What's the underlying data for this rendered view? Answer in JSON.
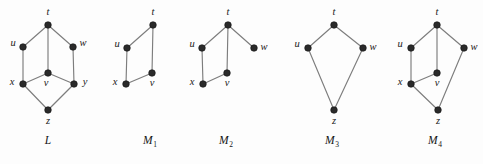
{
  "figure": {
    "background_color": "#fdfdfd",
    "edge_color": "#7d7d7d",
    "vertex_color": "#2a2a2a",
    "label_color": "#1a1a1a",
    "vertex_radius": 3.3,
    "graphs": [
      {
        "id": "L",
        "caption": "L",
        "caption_sub": "",
        "caption_x": 48,
        "caption_y": 144,
        "vertices": [
          {
            "id": "t",
            "label": "t",
            "cx": 48,
            "cy": 25,
            "lx": 48,
            "ly": 15,
            "anchor": "middle"
          },
          {
            "id": "u",
            "label": "u",
            "cx": 23,
            "cy": 47,
            "lx": 13,
            "ly": 46,
            "anchor": "middle"
          },
          {
            "id": "w",
            "label": "w",
            "cx": 73,
            "cy": 47,
            "lx": 83,
            "ly": 46,
            "anchor": "middle"
          },
          {
            "id": "v",
            "label": "v",
            "cx": 48,
            "cy": 73,
            "lx": 46,
            "ly": 86,
            "anchor": "middle"
          },
          {
            "id": "x",
            "label": "x",
            "cx": 23,
            "cy": 84,
            "lx": 12,
            "ly": 85,
            "anchor": "middle"
          },
          {
            "id": "y",
            "label": "y",
            "cx": 74,
            "cy": 84,
            "lx": 85,
            "ly": 85,
            "anchor": "middle"
          },
          {
            "id": "z",
            "label": "z",
            "cx": 48,
            "cy": 110,
            "lx": 48,
            "ly": 124,
            "anchor": "middle"
          }
        ],
        "edges": [
          [
            "t",
            "u"
          ],
          [
            "t",
            "w"
          ],
          [
            "t",
            "v"
          ],
          [
            "u",
            "x"
          ],
          [
            "w",
            "y"
          ],
          [
            "v",
            "x"
          ],
          [
            "v",
            "y"
          ],
          [
            "x",
            "z"
          ],
          [
            "y",
            "z"
          ]
        ]
      },
      {
        "id": "M1",
        "caption": "M",
        "caption_sub": "1",
        "caption_x": 150,
        "caption_y": 144,
        "vertices": [
          {
            "id": "t",
            "label": "t",
            "cx": 153,
            "cy": 25,
            "lx": 153,
            "ly": 15,
            "anchor": "middle"
          },
          {
            "id": "u",
            "label": "u",
            "cx": 127,
            "cy": 48,
            "lx": 117,
            "ly": 47,
            "anchor": "middle"
          },
          {
            "id": "v",
            "label": "v",
            "cx": 152,
            "cy": 73,
            "lx": 152,
            "ly": 86,
            "anchor": "middle"
          },
          {
            "id": "x",
            "label": "x",
            "cx": 126,
            "cy": 84,
            "lx": 115,
            "ly": 85,
            "anchor": "middle"
          }
        ],
        "edges": [
          [
            "t",
            "u"
          ],
          [
            "t",
            "v"
          ],
          [
            "u",
            "x"
          ],
          [
            "x",
            "v"
          ]
        ]
      },
      {
        "id": "M2",
        "caption": "M",
        "caption_sub": "2",
        "caption_x": 226,
        "caption_y": 144,
        "vertices": [
          {
            "id": "t",
            "label": "t",
            "cx": 228,
            "cy": 25,
            "lx": 228,
            "ly": 15,
            "anchor": "middle"
          },
          {
            "id": "u",
            "label": "u",
            "cx": 202,
            "cy": 48,
            "lx": 192,
            "ly": 47,
            "anchor": "middle"
          },
          {
            "id": "w",
            "label": "w",
            "cx": 254,
            "cy": 48,
            "lx": 264,
            "ly": 50,
            "anchor": "middle"
          },
          {
            "id": "v",
            "label": "v",
            "cx": 227,
            "cy": 73,
            "lx": 227,
            "ly": 86,
            "anchor": "middle"
          },
          {
            "id": "x",
            "label": "x",
            "cx": 203,
            "cy": 84,
            "lx": 192,
            "ly": 85,
            "anchor": "middle"
          }
        ],
        "edges": [
          [
            "t",
            "u"
          ],
          [
            "t",
            "v"
          ],
          [
            "t",
            "w"
          ],
          [
            "u",
            "x"
          ],
          [
            "x",
            "v"
          ]
        ]
      },
      {
        "id": "M3",
        "caption": "M",
        "caption_sub": "3",
        "caption_x": 332,
        "caption_y": 144,
        "vertices": [
          {
            "id": "t",
            "label": "t",
            "cx": 334,
            "cy": 25,
            "lx": 334,
            "ly": 15,
            "anchor": "middle"
          },
          {
            "id": "u",
            "label": "u",
            "cx": 308,
            "cy": 48,
            "lx": 297,
            "ly": 47,
            "anchor": "middle"
          },
          {
            "id": "w",
            "label": "w",
            "cx": 363,
            "cy": 48,
            "lx": 373,
            "ly": 50,
            "anchor": "middle"
          },
          {
            "id": "z",
            "label": "z",
            "cx": 334,
            "cy": 110,
            "lx": 334,
            "ly": 124,
            "anchor": "middle"
          }
        ],
        "edges": [
          [
            "t",
            "u"
          ],
          [
            "t",
            "w"
          ],
          [
            "u",
            "z"
          ],
          [
            "w",
            "z"
          ]
        ]
      },
      {
        "id": "M4",
        "caption": "M",
        "caption_sub": "4",
        "caption_x": 435,
        "caption_y": 144,
        "vertices": [
          {
            "id": "t",
            "label": "t",
            "cx": 437,
            "cy": 25,
            "lx": 437,
            "ly": 15,
            "anchor": "middle"
          },
          {
            "id": "u",
            "label": "u",
            "cx": 411,
            "cy": 48,
            "lx": 400,
            "ly": 47,
            "anchor": "middle"
          },
          {
            "id": "w",
            "label": "w",
            "cx": 464,
            "cy": 48,
            "lx": 474,
            "ly": 50,
            "anchor": "middle"
          },
          {
            "id": "v",
            "label": "v",
            "cx": 437,
            "cy": 73,
            "lx": 437,
            "ly": 86,
            "anchor": "middle"
          },
          {
            "id": "x",
            "label": "x",
            "cx": 411,
            "cy": 84,
            "lx": 400,
            "ly": 85,
            "anchor": "middle"
          },
          {
            "id": "z",
            "label": "z",
            "cx": 438,
            "cy": 110,
            "lx": 438,
            "ly": 124,
            "anchor": "middle"
          }
        ],
        "edges": [
          [
            "t",
            "u"
          ],
          [
            "t",
            "v"
          ],
          [
            "t",
            "w"
          ],
          [
            "u",
            "x"
          ],
          [
            "x",
            "v"
          ],
          [
            "x",
            "z"
          ],
          [
            "w",
            "z"
          ]
        ]
      }
    ]
  }
}
